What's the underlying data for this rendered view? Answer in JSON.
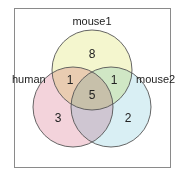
{
  "diagram": {
    "type": "venn3",
    "sets": [
      {
        "name": "human",
        "color": "#f0c8d2"
      },
      {
        "name": "mouse1",
        "color": "#f2f5c6"
      },
      {
        "name": "mouse2",
        "color": "#d2ecf2"
      }
    ],
    "labels": {
      "human": "human",
      "mouse1": "mouse1",
      "mouse2": "mouse2"
    },
    "counts": {
      "human_only": "3",
      "mouse1_only": "8",
      "mouse2_only": "2",
      "human_mouse1": "1",
      "mouse1_mouse2": "1",
      "human_mouse2": "",
      "all_three": "5"
    }
  }
}
